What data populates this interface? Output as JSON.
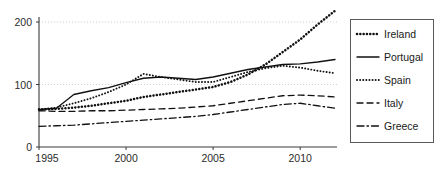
{
  "chart_data": {
    "type": "line",
    "title": "",
    "subtitle": "",
    "xlabel": "",
    "ylabel": "",
    "xlim": [
      1995,
      2012
    ],
    "ylim": [
      0,
      215
    ],
    "xticks": [
      1995,
      2000,
      2005,
      2010
    ],
    "xtick_labels": [
      "1995",
      "2000",
      "2005",
      "2010"
    ],
    "yticks": [
      0,
      100,
      200
    ],
    "ytick_labels": [
      "0",
      "100",
      "200"
    ],
    "grid": "horizontal-dotted",
    "legend_position": "right-outside",
    "x": [
      1995,
      1996,
      1997,
      1998,
      1999,
      2000,
      2001,
      2002,
      2003,
      2004,
      2005,
      2006,
      2007,
      2008,
      2009,
      2010,
      2011,
      2012
    ],
    "series": [
      {
        "name": "Ireland",
        "style": "dotted",
        "values": [
          60,
          61,
          63,
          66,
          70,
          74,
          80,
          84,
          88,
          92,
          96,
          104,
          116,
          132,
          152,
          172,
          196,
          218
        ]
      },
      {
        "name": "Portugal",
        "style": "solid",
        "values": [
          60,
          62,
          84,
          90,
          95,
          103,
          110,
          112,
          110,
          108,
          112,
          118,
          124,
          128,
          132,
          133,
          136,
          140
        ]
      },
      {
        "name": "Spain",
        "style": "fine-dotted",
        "values": [
          60,
          63,
          70,
          78,
          88,
          100,
          117,
          112,
          108,
          104,
          104,
          112,
          120,
          126,
          130,
          127,
          122,
          118
        ]
      },
      {
        "name": "Italy",
        "style": "dashed",
        "values": [
          58,
          57,
          57,
          58,
          58,
          59,
          60,
          61,
          62,
          64,
          66,
          70,
          74,
          78,
          82,
          83,
          82,
          80
        ]
      },
      {
        "name": "Greece",
        "style": "dash-dot",
        "values": [
          33,
          34,
          35,
          37,
          39,
          41,
          43,
          45,
          47,
          49,
          52,
          56,
          60,
          64,
          68,
          70,
          66,
          62
        ]
      }
    ]
  },
  "legend": {
    "entries": [
      {
        "label": "Ireland"
      },
      {
        "label": "Portugal"
      },
      {
        "label": "Spain"
      },
      {
        "label": "Italy"
      },
      {
        "label": "Greece"
      }
    ]
  },
  "axes": {
    "y_label_200": "200",
    "y_label_100": "100",
    "y_label_0": "0",
    "x_label_1995": "1995",
    "x_label_2000": "2000",
    "x_label_2005": "2005",
    "x_label_2010": "2010"
  },
  "colors": {
    "ink": "#111111",
    "axis": "#3a3a3a",
    "grid": "#c9c9c9",
    "background": "#ffffff"
  }
}
